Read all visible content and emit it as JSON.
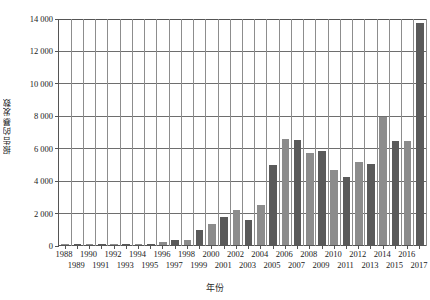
{
  "chart_data": {
    "type": "bar",
    "title": "",
    "subtitle": "",
    "xlabel": "年份",
    "ylabel": "报告的暴发数",
    "ylim": [
      0,
      14000
    ],
    "ytick_step": 2000,
    "ytick_labels": [
      "0",
      "2 000",
      "4 000",
      "6 000",
      "8 000",
      "10 000",
      "12 000",
      "14 000"
    ],
    "ytick_values": [
      0,
      2000,
      4000,
      6000,
      8000,
      10000,
      12000,
      14000
    ],
    "grid": "horizontal-and-vertical",
    "legend": "none",
    "categories": [
      "1988",
      "1989",
      "1990",
      "1991",
      "1992",
      "1993",
      "1994",
      "1995",
      "1996",
      "1997",
      "1998",
      "1999",
      "2000",
      "2001",
      "2002",
      "2003",
      "2004",
      "2005",
      "2006",
      "2007",
      "2008",
      "2009",
      "2010",
      "2011",
      "2012",
      "2013",
      "2014",
      "2015",
      "2016",
      "2017"
    ],
    "values": [
      20,
      20,
      25,
      30,
      40,
      45,
      60,
      90,
      180,
      300,
      330,
      950,
      1300,
      1700,
      2150,
      1550,
      2450,
      4950,
      6550,
      6500,
      5700,
      5800,
      4600,
      4200,
      5150,
      5000,
      7900,
      6400,
      6400,
      13700
    ],
    "bar_colors": [
      "#8c8c8c",
      "#5a5a5a",
      "#8c8c8c",
      "#5a5a5a",
      "#8c8c8c",
      "#5a5a5a",
      "#8c8c8c",
      "#5a5a5a",
      "#8c8c8c",
      "#5a5a5a",
      "#8c8c8c",
      "#5a5a5a",
      "#8c8c8c",
      "#5a5a5a",
      "#8c8c8c",
      "#5a5a5a",
      "#8c8c8c",
      "#5a5a5a",
      "#8c8c8c",
      "#5a5a5a",
      "#8c8c8c",
      "#5a5a5a",
      "#8c8c8c",
      "#5a5a5a",
      "#8c8c8c",
      "#5a5a5a",
      "#8c8c8c",
      "#5a5a5a",
      "#8c8c8c",
      "#5a5a5a"
    ],
    "xtick_rows": {
      "top": [
        "1988",
        "1990",
        "1992",
        "1994",
        "1996",
        "1998",
        "2000",
        "2002",
        "2004",
        "2006",
        "2008",
        "2010",
        "2012",
        "2014",
        "2016"
      ],
      "bottom": [
        "1989",
        "1991",
        "1993",
        "1995",
        "1997",
        "1999",
        "2001",
        "2003",
        "2005",
        "2007",
        "2009",
        "2011",
        "2013",
        "2015",
        "2017"
      ]
    },
    "colors": {
      "light_bar": "#8c8c8c",
      "dark_bar": "#5a5a5a",
      "gridline": "#6e6e6e",
      "axis": "#555555",
      "background": "#ffffff"
    }
  }
}
